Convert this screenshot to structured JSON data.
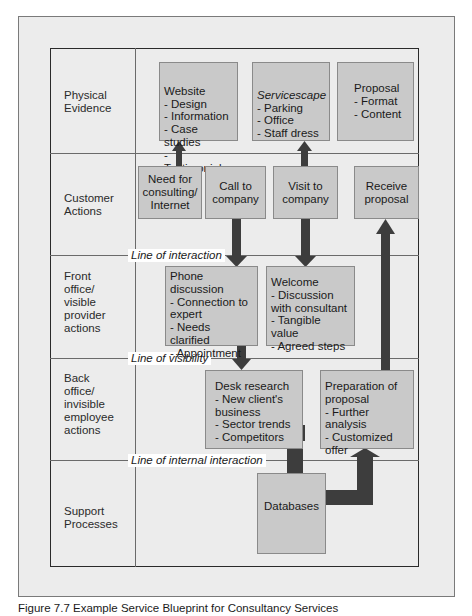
{
  "diagram": {
    "type": "service-blueprint",
    "rows": [
      {
        "label": "Physical\nEvidence"
      },
      {
        "label": "Customer\nActions"
      },
      {
        "label": "Front\noffice/\nvisible\nprovider\nactions"
      },
      {
        "label": "Back\noffice/\ninvisible\nemployee\nactions"
      },
      {
        "label": "Support\nProcesses"
      }
    ],
    "lines": {
      "interaction": "Line of interaction",
      "visibility": "Line of visibility",
      "internal_interaction": "Line of internal interaction"
    },
    "boxes": {
      "website": {
        "title": "Website",
        "items": "- Design\n- Information\n- Case studies\n- Testimonials"
      },
      "servicescape": {
        "title": "Servicescape",
        "items": "- Parking\n- Office\n- Staff dress"
      },
      "proposal": {
        "text": "Proposal\n- Format\n- Content"
      },
      "need_for_consulting": {
        "text": "Need for\nconsulting/\nInternet"
      },
      "call_to_company": {
        "text": "Call to\ncompany"
      },
      "visit_to_company": {
        "text": "Visit to\ncompany"
      },
      "receive_proposal": {
        "text": "Receive\nproposal"
      },
      "phone_discussion": {
        "text": "Phone\ndiscussion\n- Connection to\n  expert\n- Needs clarified\n- Appointment"
      },
      "welcome": {
        "text": "Welcome\n- Discussion\n  with consultant\n- Tangible value\n- Agreed steps"
      },
      "desk_research": {
        "text": "Desk research\n- New client's\n  business\n- Sector trends\n- Competitors"
      },
      "preparation_of_proposal": {
        "text": "Preparation of\nproposal\n- Further analysis\n- Customized\n  offer"
      },
      "databases": {
        "text": "Databases"
      }
    },
    "arrows": [
      {
        "from": "need_for_consulting",
        "to": "website"
      },
      {
        "from": "visit_to_company",
        "to": "servicescape"
      },
      {
        "from": "call_to_company",
        "to": "phone_discussion"
      },
      {
        "from": "visit_to_company",
        "to": "welcome"
      },
      {
        "from": "phone_discussion",
        "to": "desk_research"
      },
      {
        "from": "preparation_of_proposal",
        "to": "receive_proposal"
      },
      {
        "from": "databases",
        "to": "desk_research"
      },
      {
        "from": "databases",
        "to": "preparation_of_proposal"
      }
    ],
    "colors": {
      "frame_bg": "#ececec",
      "box_fill": "#c9c9c9",
      "arrow_fill": "#3d3d3d"
    }
  },
  "caption": "Figure 7.7  Example Service Blueprint for Consultancy Services"
}
